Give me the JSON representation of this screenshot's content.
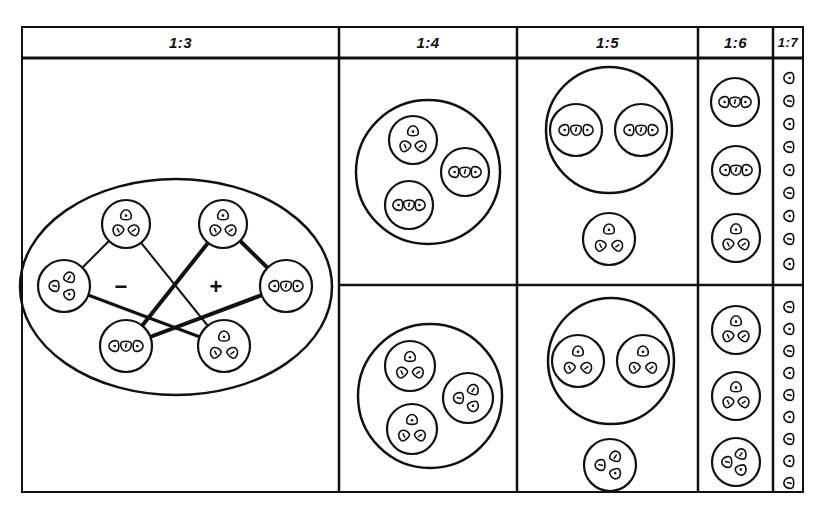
{
  "frame": {
    "x": 22,
    "y": 27,
    "w": 781,
    "h": 465,
    "header_h": 31,
    "row_split_y": 285,
    "line_color": "#111111",
    "background": "#ffffff"
  },
  "columns": [
    {
      "id": "c13",
      "label": "1:3",
      "x0": 22,
      "x1": 339
    },
    {
      "id": "c14",
      "label": "1:4",
      "x0": 339,
      "x1": 517
    },
    {
      "id": "c15",
      "label": "1:5",
      "x0": 517,
      "x1": 698
    },
    {
      "id": "c16",
      "label": "1:6",
      "x0": 698,
      "x1": 773
    },
    {
      "id": "c17",
      "label": "1:7",
      "x0": 773,
      "x1": 803
    }
  ],
  "panel_1_3": {
    "ellipse": {
      "cx": 176,
      "cy": 287,
      "rx": 156,
      "ry": 108
    },
    "nodes": [
      {
        "id": "top-left",
        "cx": 126,
        "cy": 224,
        "r": 24,
        "arrangement": "triangle"
      },
      {
        "id": "top-right",
        "cx": 223,
        "cy": 224,
        "r": 24,
        "arrangement": "triangle"
      },
      {
        "id": "left",
        "cx": 64,
        "cy": 286,
        "r": 26,
        "arrangement": "triangle-left"
      },
      {
        "id": "right",
        "cx": 286,
        "cy": 286,
        "r": 26,
        "arrangement": "row"
      },
      {
        "id": "bottom-left",
        "cx": 126,
        "cy": 346,
        "r": 26,
        "arrangement": "row"
      },
      {
        "id": "bottom-right",
        "cx": 224,
        "cy": 346,
        "r": 26,
        "arrangement": "triangle"
      }
    ],
    "links": [
      {
        "from": "top-left",
        "to": "left",
        "weight": 2
      },
      {
        "from": "top-left",
        "to": "bottom-right",
        "weight": 2
      },
      {
        "from": "left",
        "to": "bottom-right",
        "weight": 3
      },
      {
        "from": "top-right",
        "to": "right",
        "weight": 4
      },
      {
        "from": "top-right",
        "to": "bottom-left",
        "weight": 4
      },
      {
        "from": "right",
        "to": "bottom-left",
        "weight": 4
      }
    ],
    "signs": [
      {
        "text": "−",
        "x": 121,
        "y": 288,
        "label": "minus"
      },
      {
        "text": "+",
        "x": 216,
        "y": 288,
        "label": "plus"
      }
    ]
  },
  "panels": [
    {
      "id": "1-4-top",
      "big": {
        "cx": 428,
        "cy": 172,
        "r": 72
      },
      "groups": [
        {
          "cx": 413,
          "cy": 140,
          "r": 24,
          "arrangement": "triangle"
        },
        {
          "cx": 465,
          "cy": 172,
          "r": 24,
          "arrangement": "row"
        },
        {
          "cx": 409,
          "cy": 205,
          "r": 24,
          "arrangement": "row"
        }
      ]
    },
    {
      "id": "1-4-bottom",
      "big": {
        "cx": 430,
        "cy": 396,
        "r": 72
      },
      "groups": [
        {
          "cx": 410,
          "cy": 366,
          "r": 25,
          "arrangement": "triangle"
        },
        {
          "cx": 468,
          "cy": 398,
          "r": 25,
          "arrangement": "triangle-left"
        },
        {
          "cx": 412,
          "cy": 429,
          "r": 25,
          "arrangement": "triangle"
        }
      ]
    },
    {
      "id": "1-5-top",
      "big": {
        "cx": 609,
        "cy": 130,
        "r": 63
      },
      "groups": [
        {
          "cx": 576,
          "cy": 130,
          "r": 26,
          "arrangement": "row"
        },
        {
          "cx": 641,
          "cy": 130,
          "r": 26,
          "arrangement": "row"
        }
      ]
    },
    {
      "id": "1-5-top-single",
      "big": null,
      "groups": [
        {
          "cx": 609,
          "cy": 239,
          "r": 26,
          "arrangement": "triangle"
        }
      ]
    },
    {
      "id": "1-5-bottom",
      "big": {
        "cx": 611,
        "cy": 361,
        "r": 63
      },
      "groups": [
        {
          "cx": 578,
          "cy": 361,
          "r": 26,
          "arrangement": "triangle"
        },
        {
          "cx": 643,
          "cy": 361,
          "r": 26,
          "arrangement": "triangle"
        }
      ]
    },
    {
      "id": "1-5-bottom-single",
      "big": null,
      "groups": [
        {
          "cx": 610,
          "cy": 465,
          "r": 26,
          "arrangement": "triangle-left"
        }
      ]
    },
    {
      "id": "1-6-top",
      "big": null,
      "groups": [
        {
          "cx": 735,
          "cy": 102,
          "r": 24,
          "arrangement": "row"
        },
        {
          "cx": 736,
          "cy": 170,
          "r": 24,
          "arrangement": "row"
        },
        {
          "cx": 736,
          "cy": 238,
          "r": 24,
          "arrangement": "triangle"
        }
      ]
    },
    {
      "id": "1-6-bottom",
      "big": null,
      "groups": [
        {
          "cx": 736,
          "cy": 330,
          "r": 24,
          "arrangement": "triangle"
        },
        {
          "cx": 736,
          "cy": 396,
          "r": 24,
          "arrangement": "triangle"
        },
        {
          "cx": 736,
          "cy": 462,
          "r": 24,
          "arrangement": "triangle-left"
        }
      ]
    }
  ],
  "column_1_7": {
    "x": 789,
    "top_cells_y": [
      78,
      101,
      124,
      147,
      170,
      193,
      216,
      239,
      264
    ],
    "bottom_cells_y": [
      307,
      329,
      351,
      373,
      395,
      417,
      439,
      461,
      483
    ]
  }
}
